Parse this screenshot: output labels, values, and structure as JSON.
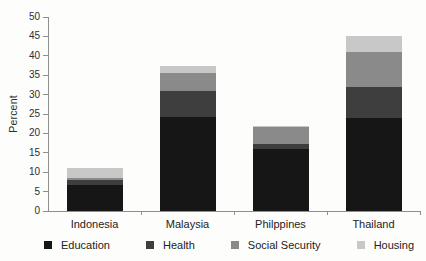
{
  "figure": {
    "background": "#fdfdfc"
  },
  "chart_data": {
    "type": "bar",
    "stacked": true,
    "title": "",
    "xlabel": "",
    "ylabel": "Percent",
    "ylim": [
      0,
      50
    ],
    "yticks": [
      0,
      5,
      10,
      15,
      20,
      25,
      30,
      35,
      40,
      45,
      50
    ],
    "grid": false,
    "legend_position": "bottom",
    "axis_color": "#8f8f8f",
    "text_color": "#2e2e2e",
    "categories": [
      "Indonesia",
      "Malaysia",
      "Philppines",
      "Thailand"
    ],
    "series": [
      {
        "name": "Education",
        "color": "#161616",
        "values": [
          6.8,
          24.3,
          16.0,
          24.0
        ]
      },
      {
        "name": "Health",
        "color": "#3e3e3e",
        "values": [
          1.1,
          6.5,
          1.3,
          8.0
        ]
      },
      {
        "name": "Social Security",
        "color": "#8a8a8a",
        "values": [
          0.6,
          4.7,
          4.4,
          9.1
        ]
      },
      {
        "name": "Housing",
        "color": "#c8c8c8",
        "values": [
          2.7,
          2.0,
          0.3,
          4.1
        ]
      }
    ]
  }
}
